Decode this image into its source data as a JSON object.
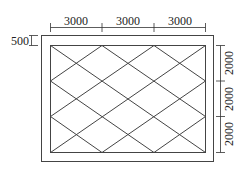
{
  "diagram": {
    "type": "tile-layout-plan",
    "colors": {
      "line": "#444444",
      "background": "#ffffff",
      "text": "#222222"
    },
    "top_dimensions": [
      "3000",
      "3000",
      "3000"
    ],
    "right_dimensions": [
      "2000",
      "2000",
      "2000"
    ],
    "border_dimension": "500",
    "grid": {
      "columns": 3,
      "rows": 3,
      "pattern": "diagonal-cross-per-cell"
    }
  }
}
